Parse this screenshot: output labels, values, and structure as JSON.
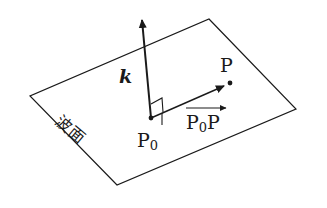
{
  "diagram": {
    "title": "",
    "labels": {
      "wave_vector": "k",
      "point_p": "P",
      "point_p0_main": "P",
      "point_p0_sub": "0",
      "vector_main": "P",
      "vector_sub": "0",
      "vector_end": "P",
      "plane_label": "波面"
    },
    "colors": {
      "line": "#1a1a1a",
      "background": "#ffffff"
    },
    "geometry": {
      "plane_corners": [
        [
          209,
          19
        ],
        [
          296,
          109
        ],
        [
          117,
          185
        ],
        [
          30,
          96
        ]
      ],
      "p0": [
        151,
        118
      ],
      "k_tip": [
        141,
        15
      ],
      "p": [
        230,
        83
      ]
    }
  }
}
